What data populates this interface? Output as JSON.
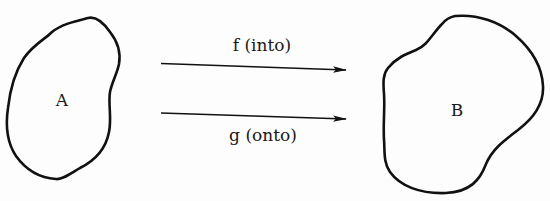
{
  "diagram": {
    "type": "set-mapping",
    "stroke_color": "#111111",
    "sets": [
      {
        "id": "A",
        "label": "A"
      },
      {
        "id": "B",
        "label": "B"
      }
    ],
    "arrows": [
      {
        "id": "f",
        "label": "f (into)",
        "from": "A",
        "to": "B"
      },
      {
        "id": "g",
        "label": "g (onto)",
        "from": "A",
        "to": "B"
      }
    ]
  }
}
